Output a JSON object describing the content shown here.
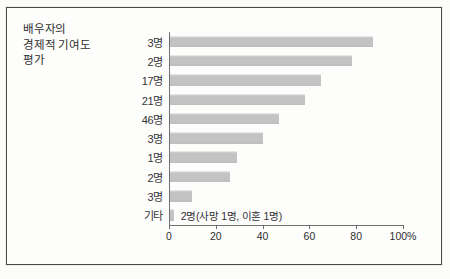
{
  "figure": {
    "title_lines": [
      "배우자의",
      "경제적 기여도",
      "평가"
    ],
    "bar_color": "#c3c3c3",
    "axis_color": "#6f6f6f",
    "frame_color": "#4a4a4a"
  },
  "chart_data": {
    "type": "bar",
    "orientation": "horizontal",
    "title": "배우자의 경제적 기여도 평가",
    "xlabel": "",
    "ylabel": "",
    "xlim": [
      0,
      100
    ],
    "grid": false,
    "legend": null,
    "unit_suffix": "%",
    "categories": [
      "3명",
      "2명",
      "17명",
      "21명",
      "46명",
      "3명",
      "1명",
      "2명",
      "3명",
      "기타"
    ],
    "values": [
      87,
      78,
      65,
      58,
      47,
      40,
      29,
      26,
      10,
      2
    ],
    "annotations": [
      {
        "category": "기타",
        "text": "2명(사망 1명, 이혼 1명)"
      }
    ],
    "xticks": [
      0,
      20,
      40,
      60,
      80,
      100
    ],
    "xtick_labels": [
      "0",
      "20",
      "40",
      "60",
      "80",
      "100%"
    ]
  }
}
